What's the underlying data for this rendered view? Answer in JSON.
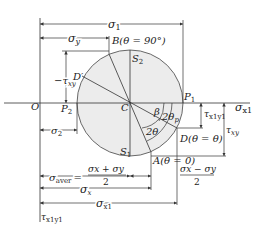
{
  "diagram": {
    "colors": {
      "circle_fill": "#ececec",
      "stroke": "#333333",
      "text": "#222222",
      "background": "#ffffff"
    },
    "points": {
      "origin": "O",
      "center": "C",
      "p1": "P",
      "p1_sub": "1",
      "p2": "P",
      "p2_sub": "2",
      "s1": "S",
      "s1_sub": "1",
      "s2": "S",
      "s2_sub": "2",
      "b": "B(θ = 90°)",
      "a": "A(θ = 0)",
      "d": "D(θ = θ)",
      "d_prime": "D′"
    },
    "axes": {
      "horizontal": "σ",
      "horizontal_sub": "x1",
      "vertical": "τ",
      "vertical_sub": "x1y1"
    },
    "dimensions": {
      "sigma1": "σ",
      "sigma1_sub": "1",
      "sigma_y": "σ",
      "sigma_y_sub": "y",
      "sigma2": "σ",
      "sigma2_sub": "2",
      "neg_tau_xy": "−τ",
      "neg_tau_xy_sub": "xy",
      "tau_x1y1": "τ",
      "tau_x1y1_sub": "x1y1",
      "tau_xy": "τ",
      "tau_xy_sub": "xy",
      "sigma_aver": "σ",
      "sigma_aver_sub": "aver",
      "sigma_aver_eq": "=",
      "sigma_aver_num": "σx + σy",
      "sigma_aver_den": "2",
      "half_diff_num": "σx − σy",
      "half_diff_den": "2",
      "sigma_x": "σ",
      "sigma_x_sub": "x",
      "sigma_x1": "σ",
      "sigma_x1_sub": "x1"
    },
    "angles": {
      "beta": "β",
      "two_theta_p": "2θ",
      "two_theta_p_sub": "p",
      "two_theta": "2θ"
    }
  }
}
